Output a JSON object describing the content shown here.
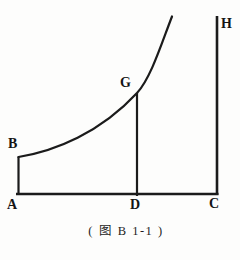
{
  "figure": {
    "caption": "( 图 B 1-1 )",
    "labels": {
      "A": "A",
      "B": "B",
      "C": "C",
      "D": "D",
      "G": "G",
      "H": "H"
    },
    "colors": {
      "line": "#1b1b1b",
      "text": "#141414",
      "background": "#fdfdfc"
    }
  }
}
